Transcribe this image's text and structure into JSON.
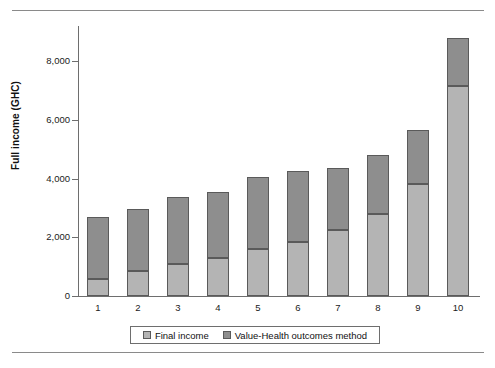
{
  "chart_data": {
    "type": "bar",
    "stacked": true,
    "title": "",
    "xlabel": "",
    "ylabel": "Full income (GHC)",
    "categories": [
      "1",
      "2",
      "3",
      "4",
      "5",
      "6",
      "7",
      "8",
      "9",
      "10"
    ],
    "series": [
      {
        "name": "Final income",
        "color": "#b4b4b4",
        "values": [
          580,
          850,
          1100,
          1300,
          1600,
          1850,
          2250,
          2800,
          3800,
          7150
        ]
      },
      {
        "name": "Value-Health outcomes method",
        "color": "#8e8e8e",
        "values": [
          2120,
          2100,
          2280,
          2240,
          2450,
          2400,
          2120,
          2000,
          1850,
          1650
        ]
      }
    ],
    "totals": [
      2700,
      2950,
      3380,
      3540,
      4050,
      4250,
      4370,
      4800,
      5650,
      8800
    ],
    "ylim": [
      0,
      9200
    ],
    "yticks": [
      0,
      2000,
      4000,
      6000,
      8000
    ],
    "ytick_labels": [
      "0",
      "2,000",
      "4,000",
      "6,000",
      "8,000"
    ],
    "grid": false,
    "legend_position": "bottom"
  },
  "axes": {
    "y_title": "Full income (GHC)",
    "y_tick_labels": [
      "8,000",
      "6,000",
      "4,000",
      "2,000",
      "0"
    ],
    "x_tick_labels": [
      "1",
      "2",
      "3",
      "4",
      "5",
      "6",
      "7",
      "8",
      "9",
      "10"
    ]
  },
  "legend": {
    "entries": [
      {
        "label": "Final income",
        "color": "#b4b4b4"
      },
      {
        "label": "Value-Health outcomes method",
        "color": "#8e8e8e"
      }
    ]
  }
}
